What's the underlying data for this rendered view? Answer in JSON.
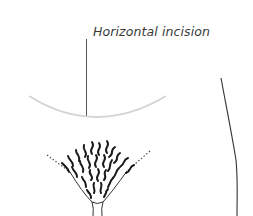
{
  "diagram": {
    "label": "Horizontal incision",
    "colors": {
      "incision_line": "#d0d0d0",
      "leader_line": "#555555",
      "outline": "#2a2a2a",
      "hair": "#1a1a1a"
    }
  }
}
